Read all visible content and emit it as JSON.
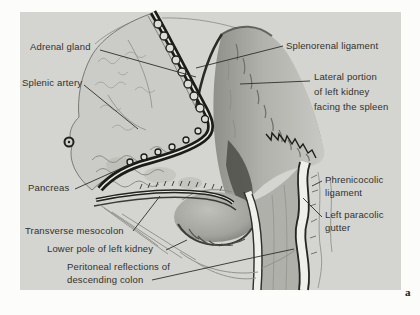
{
  "figure": {
    "panel_letter": "a",
    "labels": {
      "adrenal_gland": "Adrenal gland",
      "splenic_artery": "Splenic artery",
      "pancreas": "Pancreas",
      "transverse_mesocolon": "Transverse mesocolon",
      "lower_pole": "Lower pole of left kidney",
      "peritoneal_reflections": "Peritoneal reflections of\ndescending colon",
      "splenorenal_ligament": "Splenorenal ligament",
      "lateral_portion": "Lateral portion\nof left kidney\nfacing the spleen",
      "phrenicocolic_ligament": "Phrenicocolic\nligament",
      "left_paracolic_gutter": "Left paracolic\ngutter"
    },
    "colors": {
      "panel_background": "#d4d4d0",
      "page_background": "#fcfcfa",
      "ink": "#32322e",
      "dark_band": "#1b1b18"
    }
  }
}
